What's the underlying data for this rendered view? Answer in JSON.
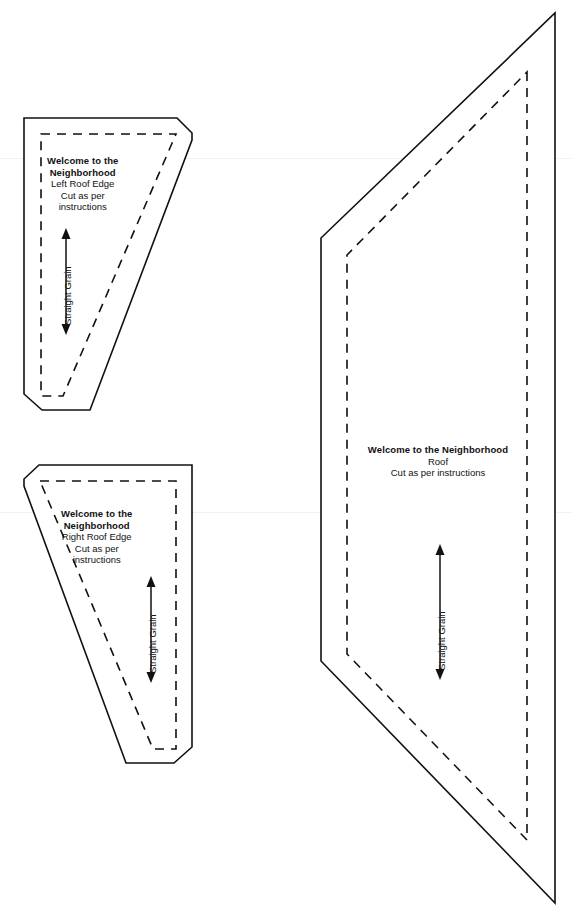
{
  "sheet": {
    "title": "Welcome to the Neighborhood Pattern Sheet",
    "background_color": "#ffffff",
    "line_color": "#111111",
    "width": 572,
    "height": 911
  },
  "pieces": [
    {
      "id": "left-roof-edge",
      "pattern_name": "Welcome to the",
      "pattern_name_2": "Neighborhood",
      "piece_label": "Left Roof Edge",
      "instruction_line_1": "Cut as per",
      "instruction_line_2": "instructions",
      "grain_label": "Straight Grain"
    },
    {
      "id": "right-roof-edge",
      "pattern_name": "Welcome to the",
      "pattern_name_2": "Neighborhood",
      "piece_label": "Right Roof Edge",
      "instruction_line_1": "Cut as per",
      "instruction_line_2": "instructions",
      "grain_label": "Straight Grain"
    },
    {
      "id": "roof",
      "pattern_name": "Welcome to the Neighborhood",
      "piece_label": "Roof",
      "instruction_line_1": "Cut as per instructions",
      "grain_label": "Straight Grain"
    }
  ]
}
